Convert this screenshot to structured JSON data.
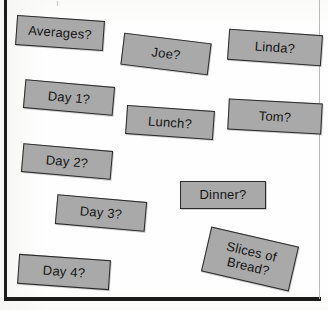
{
  "page": {
    "kind": "scanned-worksheet",
    "background_color": "#fefefe",
    "border_color": "#1b1b1b",
    "right_border_color": "#b9b9b9",
    "top_cut_text": ". | . , .",
    "card_fill_color": "#a9a9a9",
    "card_border_color": "#2a2a2a",
    "card_text_color": "#141414"
  },
  "cards": [
    {
      "label": "Averages?",
      "name": "card-averages",
      "left": 16,
      "top": 18,
      "width": 88,
      "height": 30,
      "rotate": 4,
      "font_size": 13
    },
    {
      "label": "Joe?",
      "name": "card-joe",
      "left": 122,
      "top": 38,
      "width": 88,
      "height": 32,
      "rotate": 7,
      "font_size": 13
    },
    {
      "label": "Linda?",
      "name": "card-linda",
      "left": 228,
      "top": 32,
      "width": 94,
      "height": 31,
      "rotate": 4,
      "font_size": 13
    },
    {
      "label": "Day 1?",
      "name": "card-day-1",
      "left": 24,
      "top": 83,
      "width": 90,
      "height": 29,
      "rotate": 5,
      "font_size": 13
    },
    {
      "label": "Lunch?",
      "name": "card-lunch",
      "left": 126,
      "top": 108,
      "width": 88,
      "height": 29,
      "rotate": 4,
      "font_size": 13
    },
    {
      "label": "Tom?",
      "name": "card-tom",
      "left": 228,
      "top": 101,
      "width": 94,
      "height": 31,
      "rotate": 3,
      "font_size": 13
    },
    {
      "label": "Day 2?",
      "name": "card-day-2",
      "left": 22,
      "top": 147,
      "width": 90,
      "height": 29,
      "rotate": 5,
      "font_size": 13
    },
    {
      "label": "Dinner?",
      "name": "card-dinner",
      "left": 180,
      "top": 181,
      "width": 86,
      "height": 28,
      "rotate": 0,
      "font_size": 13
    },
    {
      "label": "Day 3?",
      "name": "card-day-3",
      "left": 56,
      "top": 198,
      "width": 90,
      "height": 30,
      "rotate": 5,
      "font_size": 13
    },
    {
      "label": "Slices of\nBread?",
      "name": "card-slices-of-bread",
      "left": 205,
      "top": 236,
      "width": 90,
      "height": 46,
      "rotate": 13,
      "font_size": 13
    },
    {
      "label": "Day 4?",
      "name": "card-day-4",
      "left": 18,
      "top": 257,
      "width": 92,
      "height": 30,
      "rotate": 4,
      "font_size": 13
    }
  ]
}
